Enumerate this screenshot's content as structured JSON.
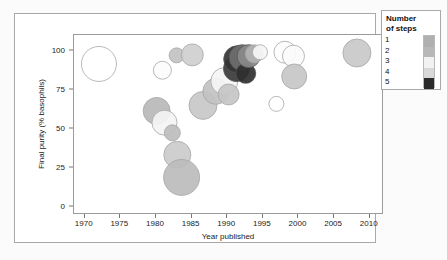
{
  "chart_data": {
    "type": "scatter",
    "title": "",
    "xlabel": "Year published",
    "ylabel": "Final purity (% basophils)",
    "xlim": [
      1968.5,
      2012
    ],
    "ylim": [
      -5,
      110
    ],
    "xticks": [
      1970,
      1975,
      1980,
      1985,
      1990,
      1995,
      2000,
      2005,
      2010
    ],
    "yticks": [
      0,
      25,
      50,
      75,
      100
    ],
    "grid": false,
    "size_meaning": "bubble area scales with sample/experiment weight",
    "legend": {
      "title_line1": "Number",
      "title_line2": "of steps",
      "position": "right",
      "keys": [
        "1",
        "2",
        "3",
        "4",
        "5"
      ],
      "colors": [
        "#b0b0b0",
        "#b8b8b8",
        "#f2f2f2",
        "#d8d8d8",
        "#2b2b2b"
      ]
    },
    "points": [
      {
        "x": 1972.0,
        "y": 91.5,
        "r": 17.5,
        "steps": 3,
        "fill": "#ffffff"
      },
      {
        "x": 1980.9,
        "y": 87.5,
        "r": 9.0,
        "steps": 3,
        "fill": "#fcfcfc"
      },
      {
        "x": 1982.9,
        "y": 97.0,
        "r": 7.5,
        "steps": 2,
        "fill": "#c2c2c2"
      },
      {
        "x": 1985.1,
        "y": 97.3,
        "r": 11.0,
        "steps": 2,
        "fill": "#cfcfcf"
      },
      {
        "x": 1980.1,
        "y": 61.5,
        "r": 13.5,
        "steps": 2,
        "fill": "#b9b9b9"
      },
      {
        "x": 1981.2,
        "y": 54.0,
        "r": 12.5,
        "steps": 3,
        "fill": "#f4f4f4"
      },
      {
        "x": 1982.3,
        "y": 47.5,
        "r": 8.0,
        "steps": 2,
        "fill": "#bdbdbd"
      },
      {
        "x": 1983.0,
        "y": 33.5,
        "r": 13.5,
        "steps": 2,
        "fill": "#cbcbcb"
      },
      {
        "x": 1983.6,
        "y": 19.0,
        "r": 18.0,
        "steps": 2,
        "fill": "#bcbcbc"
      },
      {
        "x": 1986.6,
        "y": 65.0,
        "r": 14.0,
        "steps": 2,
        "fill": "#c8c8c8"
      },
      {
        "x": 1988.4,
        "y": 74.0,
        "r": 13.0,
        "steps": 2,
        "fill": "#c2c2c2"
      },
      {
        "x": 1989.6,
        "y": 80.5,
        "r": 13.5,
        "steps": 3,
        "fill": "#f5f5f5"
      },
      {
        "x": 1990.2,
        "y": 72.0,
        "r": 10.5,
        "steps": 2,
        "fill": "#c6c6c6"
      },
      {
        "x": 1991.3,
        "y": 88.5,
        "r": 13.0,
        "steps": 5,
        "fill": "#3a3a3a"
      },
      {
        "x": 1991.4,
        "y": 94.5,
        "r": 13.5,
        "steps": 5,
        "fill": "#343434"
      },
      {
        "x": 1992.1,
        "y": 95.5,
        "r": 13.0,
        "steps": 4,
        "fill": "#6f6f6f"
      },
      {
        "x": 1992.6,
        "y": 85.5,
        "r": 10.0,
        "steps": 5,
        "fill": "#2f2f2f"
      },
      {
        "x": 1993.0,
        "y": 96.5,
        "r": 11.5,
        "steps": 4,
        "fill": "#8a8a8a"
      },
      {
        "x": 1993.8,
        "y": 98.0,
        "r": 9.0,
        "steps": 3,
        "fill": "#b3b3b3"
      },
      {
        "x": 1994.6,
        "y": 99.0,
        "r": 7.5,
        "steps": 3,
        "fill": "#f6f6f6"
      },
      {
        "x": 1998.1,
        "y": 99.0,
        "r": 11.0,
        "steps": 3,
        "fill": "#fdfdfd"
      },
      {
        "x": 1999.3,
        "y": 96.5,
        "r": 11.0,
        "steps": 3,
        "fill": "#fbfbfb"
      },
      {
        "x": 1999.4,
        "y": 83.5,
        "r": 12.5,
        "steps": 2,
        "fill": "#c7c7c7"
      },
      {
        "x": 1996.9,
        "y": 66.0,
        "r": 7.5,
        "steps": 3,
        "fill": "#ffffff"
      },
      {
        "x": 2008.2,
        "y": 98.5,
        "r": 14.0,
        "steps": 2,
        "fill": "#c9c9c9"
      }
    ]
  }
}
